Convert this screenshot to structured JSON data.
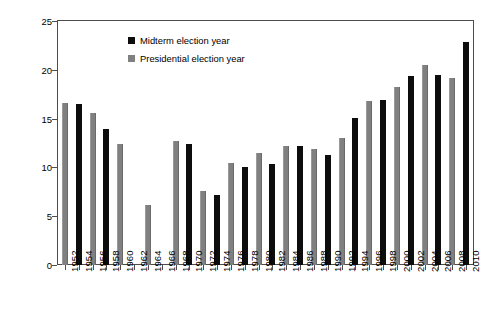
{
  "chart_data": {
    "type": "bar",
    "title": "",
    "xlabel": "",
    "ylabel": "Difference in Presidential Vote Between Republican and Democratic Districts (Percent)",
    "ylabel_line1": "Difference in Presidential Vote Between Republican",
    "ylabel_line2": "and Democratic Districts (Percent)",
    "ylim": [
      0,
      25
    ],
    "yticks": [
      0,
      5,
      10,
      15,
      20,
      25
    ],
    "ytick_labels": [
      "0",
      "5",
      "10",
      "15",
      "20",
      "25"
    ],
    "grid": false,
    "legend_position": "upper-left-inside",
    "categories": [
      "1952",
      "1954",
      "1956",
      "1958",
      "1960",
      "1962",
      "1964",
      "1966",
      "1968",
      "1970",
      "1972",
      "1974",
      "1976",
      "1978",
      "1980",
      "1982",
      "1984",
      "1986",
      "1988",
      "1990",
      "1992",
      "1994",
      "1996",
      "1998",
      "2000",
      "2002",
      "2004",
      "2006",
      "2008",
      "2010"
    ],
    "values": [
      16.6,
      16.5,
      15.6,
      13.9,
      12.4,
      null,
      6.2,
      null,
      12.7,
      12.4,
      7.6,
      7.2,
      10.5,
      10.0,
      11.5,
      10.4,
      12.2,
      12.2,
      11.9,
      11.3,
      13.0,
      15.1,
      16.8,
      16.9,
      18.2,
      19.4,
      20.5,
      19.5,
      19.2,
      22.8
    ],
    "series_of": [
      "presidential",
      "midterm",
      "presidential",
      "midterm",
      "presidential",
      "midterm",
      "presidential",
      "midterm",
      "presidential",
      "midterm",
      "presidential",
      "midterm",
      "presidential",
      "midterm",
      "presidential",
      "midterm",
      "presidential",
      "midterm",
      "presidential",
      "midterm",
      "presidential",
      "midterm",
      "presidential",
      "midterm",
      "presidential",
      "midterm",
      "presidential",
      "midterm",
      "presidential",
      "midterm"
    ],
    "series": [
      {
        "name": "Midterm election year",
        "color": "#0d0d0d",
        "points": [
          {
            "x": "1954",
            "y": 16.5
          },
          {
            "x": "1958",
            "y": 13.9
          },
          {
            "x": "1962",
            "y": null
          },
          {
            "x": "1966",
            "y": null
          },
          {
            "x": "1970",
            "y": 12.4
          },
          {
            "x": "1974",
            "y": 7.2
          },
          {
            "x": "1978",
            "y": 10.0
          },
          {
            "x": "1982",
            "y": 10.4
          },
          {
            "x": "1986",
            "y": 12.2
          },
          {
            "x": "1990",
            "y": 11.3
          },
          {
            "x": "1994",
            "y": 15.1
          },
          {
            "x": "1998",
            "y": 16.9
          },
          {
            "x": "2002",
            "y": 19.4
          },
          {
            "x": "2006",
            "y": 19.5
          },
          {
            "x": "2010",
            "y": 22.8
          }
        ]
      },
      {
        "name": "Presidential election year",
        "color": "#808080",
        "points": [
          {
            "x": "1952",
            "y": 16.6
          },
          {
            "x": "1956",
            "y": 15.6
          },
          {
            "x": "1960",
            "y": 12.4
          },
          {
            "x": "1964",
            "y": 6.2
          },
          {
            "x": "1968",
            "y": 12.7
          },
          {
            "x": "1972",
            "y": 7.6
          },
          {
            "x": "1976",
            "y": 10.5
          },
          {
            "x": "1980",
            "y": 11.5
          },
          {
            "x": "1984",
            "y": 12.2
          },
          {
            "x": "1988",
            "y": 11.9
          },
          {
            "x": "1992",
            "y": 13.0
          },
          {
            "x": "1996",
            "y": 16.8
          },
          {
            "x": "2000",
            "y": 18.2
          },
          {
            "x": "2004",
            "y": 20.5
          },
          {
            "x": "2008",
            "y": 19.2
          }
        ]
      }
    ]
  },
  "legend": {
    "items": [
      {
        "label": "Midterm election year",
        "key": "midterm"
      },
      {
        "label": "Presidential election year",
        "key": "presidential"
      }
    ]
  },
  "colors": {
    "midterm": "#0d0d0d",
    "presidential": "#808080",
    "axis": "#4d4d4d",
    "background": "#ffffff"
  }
}
